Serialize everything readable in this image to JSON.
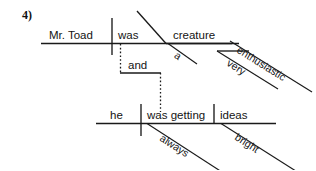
{
  "exercise": {
    "number_label": "4)"
  },
  "diagram": {
    "type": "reed-kellogg-sentence-diagram",
    "ink_color": "#1a1a1a",
    "background_color": "#ffffff",
    "main_clause": {
      "subject": "Mr. Toad",
      "verb": "was",
      "predicate_nominative": "creature",
      "article_modifier": "a",
      "adjective_modifier": "enthusiastic",
      "adverb_modifier": "very"
    },
    "conjunction": "and",
    "second_clause": {
      "subject": "he",
      "verb": "was getting",
      "direct_object": "ideas",
      "adverb_modifier": "always",
      "adjective_modifier": "bright"
    }
  }
}
